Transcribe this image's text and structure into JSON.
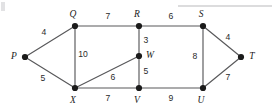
{
  "figure": {
    "kind": "weighted-undirected-graph",
    "width": 275,
    "height": 110,
    "background_color": "#ffffff",
    "edge_color": "#58585a",
    "node_color": "#1b1b1b",
    "label_color": "#1b1b1b"
  },
  "nodes": [
    {
      "id": "P",
      "label": "P",
      "x": 25,
      "y": 57,
      "label_x": 14,
      "label_y": 57
    },
    {
      "id": "Q",
      "label": "Q",
      "x": 75,
      "y": 26,
      "label_x": 73,
      "label_y": 15
    },
    {
      "id": "R",
      "label": "R",
      "x": 139,
      "y": 26,
      "label_x": 137,
      "label_y": 15
    },
    {
      "id": "S",
      "label": "S",
      "x": 203,
      "y": 26,
      "label_x": 201,
      "label_y": 15
    },
    {
      "id": "T",
      "label": "T",
      "x": 241,
      "y": 57,
      "label_x": 252,
      "label_y": 57
    },
    {
      "id": "U",
      "label": "U",
      "x": 203,
      "y": 88,
      "label_x": 201,
      "label_y": 101
    },
    {
      "id": "V",
      "label": "V",
      "x": 139,
      "y": 88,
      "label_x": 137,
      "label_y": 101
    },
    {
      "id": "W",
      "label": "W",
      "x": 139,
      "y": 56,
      "label_x": 150,
      "label_y": 56
    },
    {
      "id": "X",
      "label": "X",
      "x": 75,
      "y": 88,
      "label_x": 73,
      "label_y": 101
    }
  ],
  "edges": [
    {
      "from": "P",
      "to": "Q",
      "weight": "4",
      "x1": 25,
      "y1": 57,
      "x2": 75,
      "y2": 26,
      "label_x": 44,
      "label_y": 33
    },
    {
      "from": "P",
      "to": "X",
      "weight": "5",
      "x1": 25,
      "y1": 57,
      "x2": 75,
      "y2": 88,
      "label_x": 43,
      "label_y": 79
    },
    {
      "from": "Q",
      "to": "R",
      "weight": "7",
      "x1": 75,
      "y1": 26,
      "x2": 139,
      "y2": 26,
      "label_x": 108,
      "label_y": 17
    },
    {
      "from": "Q",
      "to": "X",
      "weight": "10",
      "x1": 75,
      "y1": 26,
      "x2": 75,
      "y2": 88,
      "label_x": 83,
      "label_y": 55
    },
    {
      "from": "R",
      "to": "S",
      "weight": "6",
      "x1": 139,
      "y1": 26,
      "x2": 203,
      "y2": 26,
      "label_x": 171,
      "label_y": 17
    },
    {
      "from": "R",
      "to": "W",
      "weight": "3",
      "x1": 139,
      "y1": 26,
      "x2": 139,
      "y2": 56,
      "label_x": 146,
      "label_y": 41
    },
    {
      "from": "S",
      "to": "T",
      "weight": "4",
      "x1": 203,
      "y1": 26,
      "x2": 241,
      "y2": 57,
      "label_x": 228,
      "label_y": 38
    },
    {
      "from": "S",
      "to": "U",
      "weight": "8",
      "x1": 203,
      "y1": 26,
      "x2": 203,
      "y2": 88,
      "label_x": 195,
      "label_y": 57
    },
    {
      "from": "T",
      "to": "U",
      "weight": "7",
      "x1": 241,
      "y1": 57,
      "x2": 203,
      "y2": 88,
      "label_x": 228,
      "label_y": 78
    },
    {
      "from": "W",
      "to": "V",
      "weight": "5",
      "x1": 139,
      "y1": 56,
      "x2": 139,
      "y2": 88,
      "label_x": 146,
      "label_y": 72
    },
    {
      "from": "X",
      "to": "W",
      "weight": "6",
      "x1": 75,
      "y1": 88,
      "x2": 139,
      "y2": 56,
      "label_x": 113,
      "label_y": 78
    },
    {
      "from": "X",
      "to": "V",
      "weight": "7",
      "x1": 75,
      "y1": 88,
      "x2": 139,
      "y2": 88,
      "label_x": 108,
      "label_y": 99
    },
    {
      "from": "V",
      "to": "U",
      "weight": "9",
      "x1": 139,
      "y1": 88,
      "x2": 203,
      "y2": 88,
      "label_x": 171,
      "label_y": 99
    }
  ],
  "artifacts": [
    {
      "name": "top-rule",
      "x1": 178,
      "y1": 6,
      "x2": 272,
      "y2": 6
    },
    {
      "name": "corner-smudge",
      "x": 1,
      "y": 2,
      "width": 4,
      "height": 9
    }
  ]
}
